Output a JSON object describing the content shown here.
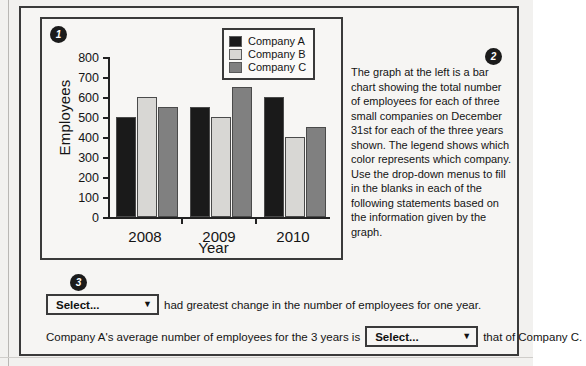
{
  "badges": {
    "one": "1",
    "two": "2",
    "three": "3"
  },
  "chart_data": {
    "type": "bar",
    "title": "",
    "xlabel": "Year",
    "ylabel": "Employees",
    "categories": [
      "2008",
      "2009",
      "2010"
    ],
    "ylim": [
      0,
      800
    ],
    "yticks": [
      0,
      100,
      200,
      300,
      400,
      500,
      600,
      700,
      800
    ],
    "ytick_labels": [
      "0",
      "100",
      "200",
      "300",
      "400",
      "500",
      "600",
      "700",
      "800"
    ],
    "grid": false,
    "legend_position": "top-right",
    "series": [
      {
        "name": "Company A",
        "color": "#1a1a1a",
        "values": [
          500,
          550,
          600
        ]
      },
      {
        "name": "Company B",
        "color": "#d8d7d4",
        "values": [
          600,
          500,
          400
        ]
      },
      {
        "name": "Company C",
        "color": "#808080",
        "values": [
          550,
          650,
          450
        ]
      }
    ]
  },
  "prose": {
    "text": "The graph at the left is a bar chart showing the total number of employees for each of three small companies on December 31st for each of the three years shown. The legend shows which color represents which company. Use the drop-down menus to fill in the blanks in each of the following statements based on the information given by the graph."
  },
  "statements": {
    "dropdown_placeholder": "Select...",
    "dropdown_arrow": "▼",
    "statement_1_suffix": "had greatest change in the number of employees for one year.",
    "statement_2_prefix": "Company A's average number of employees for the 3 years is",
    "statement_2_suffix": "that of Company C."
  }
}
